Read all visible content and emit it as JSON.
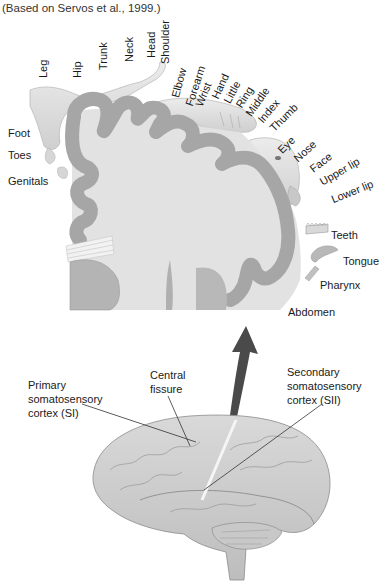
{
  "caption": "(Based on Servos et al., 1999.)",
  "homunculus": {
    "top_labels": [
      {
        "text": "Leg",
        "x": 38,
        "y": 78,
        "angle": -90
      },
      {
        "text": "Hip",
        "x": 72,
        "y": 78,
        "angle": -90
      },
      {
        "text": "Trunk",
        "x": 98,
        "y": 70,
        "angle": -90
      },
      {
        "text": "Neck",
        "x": 124,
        "y": 62,
        "angle": -90
      },
      {
        "text": "Head",
        "x": 146,
        "y": 58,
        "angle": -90
      },
      {
        "text": "Shoulder",
        "x": 160,
        "y": 64,
        "angle": -90
      },
      {
        "text": "Elbow",
        "x": 170,
        "y": 96,
        "angle": -75
      },
      {
        "text": "Forearm",
        "x": 184,
        "y": 104,
        "angle": -72
      },
      {
        "text": "Wrist",
        "x": 194,
        "y": 104,
        "angle": -68
      },
      {
        "text": "Hand",
        "x": 210,
        "y": 96,
        "angle": -65
      },
      {
        "text": "Little",
        "x": 222,
        "y": 100,
        "angle": -62
      },
      {
        "text": "Ring",
        "x": 234,
        "y": 104,
        "angle": -58
      },
      {
        "text": "Middle",
        "x": 244,
        "y": 112,
        "angle": -55
      },
      {
        "text": "Index",
        "x": 256,
        "y": 118,
        "angle": -50
      },
      {
        "text": "Thumb",
        "x": 268,
        "y": 126,
        "angle": -45
      }
    ],
    "face_labels": [
      {
        "text": "Eye",
        "x": 276,
        "y": 148,
        "angle": -45
      },
      {
        "text": "Nose",
        "x": 292,
        "y": 156,
        "angle": -42
      },
      {
        "text": "Face",
        "x": 308,
        "y": 166,
        "angle": -38
      },
      {
        "text": "Upper lip",
        "x": 318,
        "y": 178,
        "angle": -30
      },
      {
        "text": "Lower lip",
        "x": 330,
        "y": 195,
        "angle": -22
      }
    ],
    "left_labels": [
      {
        "text": "Foot",
        "x": 8,
        "y": 128
      },
      {
        "text": "Toes",
        "x": 8,
        "y": 150
      },
      {
        "text": "Genitals",
        "x": 8,
        "y": 176
      }
    ],
    "right_labels": [
      {
        "text": "Teeth",
        "x": 331,
        "y": 230
      },
      {
        "text": "Tongue",
        "x": 343,
        "y": 256
      },
      {
        "text": "Pharynx",
        "x": 320,
        "y": 280
      },
      {
        "text": "Abdomen",
        "x": 288,
        "y": 307
      }
    ]
  },
  "brain": {
    "labels": {
      "central_fissure": [
        "Central",
        "fissure"
      ],
      "primary": [
        "Primary",
        "somatosensory",
        "cortex (SI)"
      ],
      "secondary": [
        "Secondary",
        "somatosensory",
        "cortex (SII)"
      ]
    }
  },
  "colors": {
    "cortex": "#a9a9a9",
    "cortex_edge": "#8a8a8a",
    "white_matter": "#e2e2e2",
    "body": "#dedede",
    "arrow": "#4a4a4a"
  }
}
